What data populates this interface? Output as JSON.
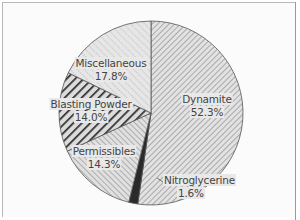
{
  "chart_data": {
    "type": "pie",
    "title": "",
    "start_angle_deg": 0,
    "direction": "clockwise",
    "slices": [
      {
        "label": "Dynamite",
        "value": 52.3,
        "value_label": "52.3%",
        "pattern": "fine-diagonal-right",
        "color": "#9a9a9a"
      },
      {
        "label": "Nitroglycerine",
        "value": 1.6,
        "value_label": "1.6%",
        "pattern": "solid",
        "color": "#2a2a2a"
      },
      {
        "label": "Permissibles",
        "value": 14.3,
        "value_label": "14.3%",
        "pattern": "diagonal-left",
        "color": "#8a8a8a"
      },
      {
        "label": "Blasting Powder",
        "value": 14.0,
        "value_label": "14.0%",
        "pattern": "heavy-diagonal-right",
        "color": "#2f2f2f"
      },
      {
        "label": "Miscellaneous",
        "value": 17.8,
        "value_label": "17.8%",
        "pattern": "dotted-diagonal-left",
        "color": "#a0a0a0"
      }
    ],
    "legend": "none"
  }
}
